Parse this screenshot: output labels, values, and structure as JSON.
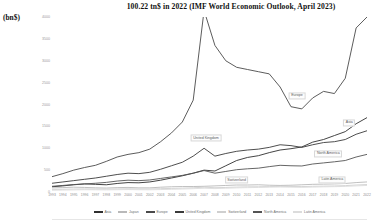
{
  "chart_data": {
    "type": "line",
    "title": "100.22 tn$ in 2022 (IMF World  Economic Outlook, April 2023)",
    "xlabel": "",
    "ylabel": "(bn$)",
    "ylim": [
      0,
      4000
    ],
    "yticks": [
      "0",
      "500",
      "1000",
      "1500",
      "2000",
      "2500",
      "3000",
      "3500",
      "4000"
    ],
    "grid": false,
    "legend_position": "bottom",
    "x": [
      1993,
      1994,
      1995,
      1996,
      1997,
      1998,
      1999,
      2000,
      2001,
      2002,
      2003,
      2004,
      2005,
      2006,
      2007,
      2008,
      2009,
      2010,
      2011,
      2012,
      2013,
      2014,
      2015,
      2016,
      2017,
      2018,
      2019,
      2020,
      2021,
      2022
    ],
    "series": [
      {
        "name": "Asia",
        "color": "#2f2f2f",
        "annotation": "Asia",
        "values": [
          120,
          140,
          165,
          185,
          175,
          165,
          195,
          215,
          210,
          230,
          270,
          320,
          370,
          430,
          500,
          480,
          600,
          720,
          790,
          830,
          900,
          960,
          990,
          1030,
          1140,
          1200,
          1290,
          1380,
          1560,
          1700
        ]
      },
      {
        "name": "Japan",
        "color": "#b9b9b9",
        "annotation": "Japan",
        "values": [
          95,
          100,
          110,
          105,
          95,
          90,
          100,
          105,
          95,
          95,
          110,
          120,
          125,
          125,
          130,
          140,
          150,
          160,
          160,
          165,
          155,
          150,
          155,
          165,
          175,
          180,
          185,
          195,
          215,
          230
        ]
      },
      {
        "name": "Europe",
        "color": "#4a4a4a",
        "annotation": "Europe",
        "values": [
          350,
          420,
          500,
          560,
          610,
          700,
          800,
          860,
          900,
          980,
          1150,
          1350,
          1600,
          2100,
          4150,
          3350,
          3000,
          2850,
          2800,
          2750,
          2700,
          2400,
          1950,
          1900,
          2150,
          2300,
          2250,
          2600,
          3750,
          4000
        ]
      },
      {
        "name": "United Kingdom",
        "color": "#3a3a3a",
        "annotation": "United Kingdom",
        "values": [
          200,
          230,
          260,
          290,
          320,
          360,
          400,
          430,
          420,
          450,
          520,
          600,
          680,
          820,
          1000,
          820,
          880,
          930,
          960,
          980,
          1020,
          1080,
          1060,
          1020,
          1080,
          1130,
          1150,
          1200,
          1320,
          1400
        ]
      },
      {
        "name": "Switzerland",
        "color": "#cfcfcf",
        "annotation": "Switzerland",
        "values": [
          60,
          62,
          68,
          70,
          68,
          66,
          70,
          74,
          70,
          70,
          76,
          82,
          88,
          96,
          110,
          98,
          104,
          112,
          118,
          120,
          124,
          128,
          126,
          124,
          130,
          134,
          138,
          146,
          160,
          170
        ]
      },
      {
        "name": "North America",
        "color": "#545454",
        "annotation": "North America",
        "values": [
          130,
          150,
          170,
          185,
          200,
          220,
          250,
          270,
          260,
          275,
          310,
          345,
          380,
          430,
          490,
          430,
          470,
          510,
          530,
          545,
          580,
          610,
          600,
          595,
          640,
          665,
          690,
          720,
          800,
          860
        ]
      },
      {
        "name": "Latin America",
        "color": "#dcdcdc",
        "annotation": "Latin America",
        "values": [
          40,
          44,
          48,
          52,
          50,
          48,
          52,
          56,
          52,
          50,
          56,
          62,
          68,
          76,
          86,
          78,
          86,
          94,
          100,
          104,
          110,
          114,
          110,
          106,
          112,
          118,
          122,
          128,
          140,
          150
        ]
      }
    ]
  }
}
